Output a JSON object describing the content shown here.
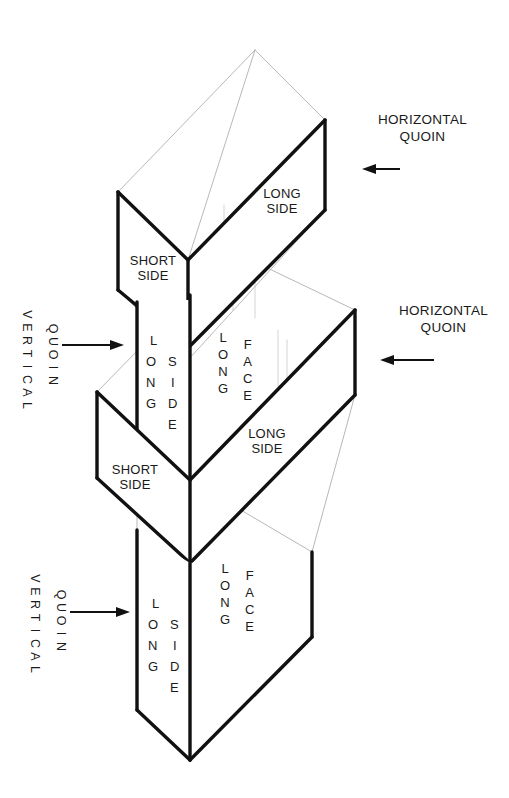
{
  "figure": {
    "background_color": "#ffffff",
    "ink_color": "#111111",
    "construction_line_color": "#c4c4c4"
  },
  "annotations": {
    "horizontal_quoin_top": {
      "line1": "HORIZONTAL",
      "line2": "QUOIN"
    },
    "horizontal_quoin_middle": {
      "line1": "HORIZONTAL",
      "line2": "QUOIN"
    },
    "vertical_quoin_upper": {
      "word1": "VERTICAL",
      "word2": "QUOIN"
    },
    "vertical_quoin_lower": {
      "word1": "VERTICAL",
      "word2": "QUOIN"
    }
  },
  "face_labels": {
    "top_long_side": {
      "line1": "LONG",
      "line2": "SIDE"
    },
    "top_short_side": {
      "line1": "SHORT",
      "line2": "SIDE"
    },
    "middle_short_side": {
      "line1": "SHORT",
      "line2": "SIDE"
    },
    "middle_long_side": {
      "line1": "LONG",
      "line2": "SIDE"
    },
    "upper_long_side_vertical": {
      "word1": "LONG",
      "word2": "SIDE"
    },
    "upper_long_face_vertical": {
      "word1": "LONG",
      "word2": "FACE"
    },
    "lower_long_side_vertical": {
      "word1": "LONG",
      "word2": "SIDE"
    },
    "lower_long_face_vertical": {
      "word1": "LONG",
      "word2": "FACE"
    }
  },
  "letters": {
    "long": [
      "L",
      "O",
      "N",
      "G"
    ],
    "side": [
      "S",
      "I",
      "D",
      "E"
    ],
    "face": [
      "F",
      "A",
      "C",
      "E"
    ],
    "vertical": [
      "V",
      "E",
      "R",
      "T",
      "I",
      "C",
      "A",
      "L"
    ],
    "quoin": [
      "Q",
      "U",
      "O",
      "I",
      "N"
    ]
  },
  "arrows": [
    {
      "name": "horizontal-quoin-top-arrow",
      "direction": "left"
    },
    {
      "name": "horizontal-quoin-middle-arrow",
      "direction": "left"
    },
    {
      "name": "vertical-quoin-upper-arrow",
      "direction": "right"
    },
    {
      "name": "vertical-quoin-lower-arrow",
      "direction": "right"
    }
  ]
}
